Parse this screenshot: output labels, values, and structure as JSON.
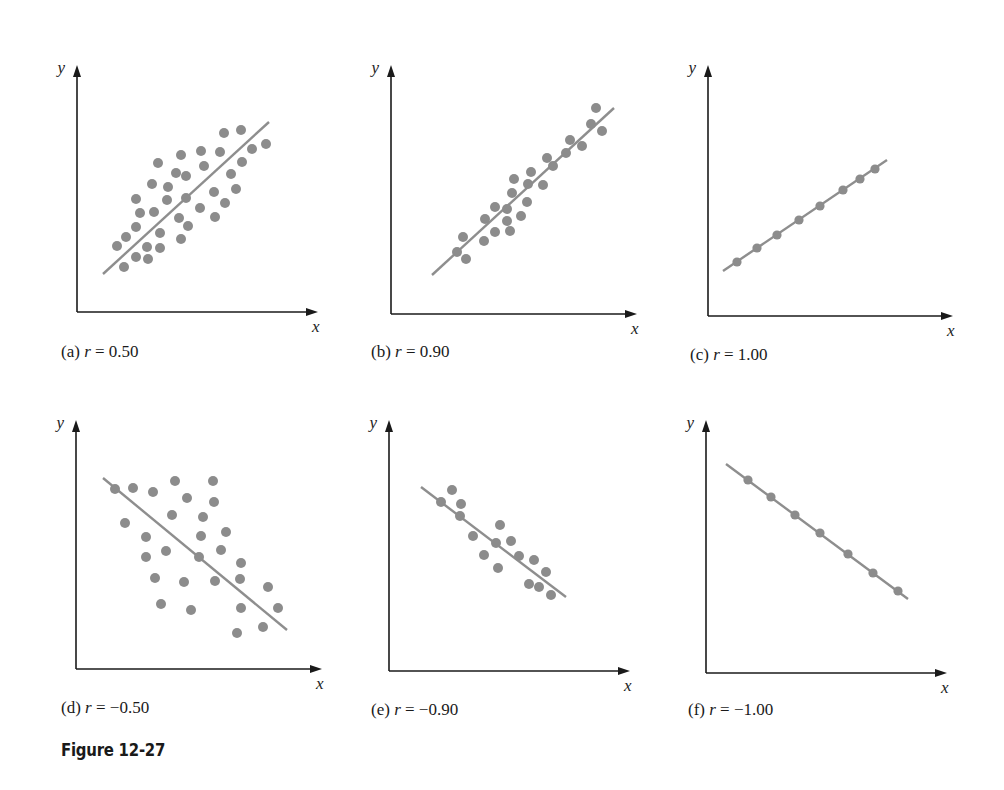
{
  "figure": {
    "title": "Figure 12-27",
    "point_color": "#8c8c8c",
    "line_color": "#8e8e8e",
    "axis_color": "#1a1a1a"
  },
  "chart_data": [
    {
      "type": "scatter",
      "id": "a",
      "caption_prefix": "(a)",
      "r_symbol": "r",
      "r_value": "0.50",
      "caption": "(a) r = 0.50",
      "xlabel": "x",
      "ylabel": "y",
      "grid": false,
      "trendline": true,
      "axes": {
        "origin": [
          77,
          312
        ],
        "y_top": 65,
        "x_end": 318
      },
      "line": [
        [
          103,
          274
        ],
        [
          269,
          122
        ]
      ],
      "points_px": [
        [
          117,
          246
        ],
        [
          126,
          237
        ],
        [
          124,
          267
        ],
        [
          136,
          257
        ],
        [
          136,
          227
        ],
        [
          140,
          213
        ],
        [
          136,
          199
        ],
        [
          147,
          247
        ],
        [
          148,
          259
        ],
        [
          160,
          233
        ],
        [
          160,
          248
        ],
        [
          154,
          212
        ],
        [
          152,
          184
        ],
        [
          158,
          163
        ],
        [
          168,
          187
        ],
        [
          167,
          200
        ],
        [
          176,
          173
        ],
        [
          181,
          155
        ],
        [
          186,
          176
        ],
        [
          186,
          198
        ],
        [
          179,
          218
        ],
        [
          181,
          239
        ],
        [
          188,
          226
        ],
        [
          200,
          208
        ],
        [
          201,
          151
        ],
        [
          204,
          166
        ],
        [
          220,
          152
        ],
        [
          214,
          192
        ],
        [
          215,
          217
        ],
        [
          225,
          203
        ],
        [
          231,
          174
        ],
        [
          236,
          189
        ],
        [
          224,
          133
        ],
        [
          241,
          130
        ],
        [
          242,
          162
        ],
        [
          252,
          149
        ],
        [
          266,
          144
        ]
      ]
    },
    {
      "type": "scatter",
      "id": "b",
      "caption_prefix": "(b)",
      "r_symbol": "r",
      "r_value": "0.90",
      "caption": "(b) r = 0.90",
      "xlabel": "x",
      "ylabel": "y",
      "grid": false,
      "trendline": true,
      "axes": {
        "origin": [
          391,
          314
        ],
        "y_top": 65,
        "x_end": 637
      },
      "line": [
        [
          432,
          275
        ],
        [
          614,
          108
        ]
      ],
      "points_px": [
        [
          457,
          252
        ],
        [
          463,
          237
        ],
        [
          466,
          259
        ],
        [
          484,
          241
        ],
        [
          485,
          219
        ],
        [
          495,
          232
        ],
        [
          495,
          207
        ],
        [
          507,
          209
        ],
        [
          507,
          221
        ],
        [
          510,
          231
        ],
        [
          512,
          193
        ],
        [
          514,
          179
        ],
        [
          521,
          216
        ],
        [
          527,
          202
        ],
        [
          528,
          184
        ],
        [
          531,
          172
        ],
        [
          543,
          185
        ],
        [
          547,
          158
        ],
        [
          553,
          166
        ],
        [
          566,
          153
        ],
        [
          570,
          140
        ],
        [
          582,
          146
        ],
        [
          591,
          124
        ],
        [
          596,
          108
        ],
        [
          602,
          131
        ]
      ]
    },
    {
      "type": "scatter",
      "id": "c",
      "caption_prefix": "(c)",
      "r_symbol": "r",
      "r_value": "1.00",
      "caption": "(c) r = 1.00",
      "xlabel": "x",
      "ylabel": "y",
      "grid": false,
      "trendline": true,
      "axes": {
        "origin": [
          708,
          316
        ],
        "y_top": 65,
        "x_end": 953
      },
      "line": [
        [
          723,
          271
        ],
        [
          887,
          160
        ]
      ],
      "points_px": [
        [
          737,
          262
        ],
        [
          757,
          248
        ],
        [
          777,
          235
        ],
        [
          799,
          220
        ],
        [
          820,
          206
        ],
        [
          843,
          190
        ],
        [
          860,
          179
        ],
        [
          875,
          169
        ]
      ]
    },
    {
      "type": "scatter",
      "id": "d",
      "caption_prefix": "(d)",
      "r_symbol": "r",
      "r_value": "−0.50",
      "caption": "(d) r = −0.50",
      "xlabel": "x",
      "ylabel": "y",
      "grid": false,
      "trendline": true,
      "axes": {
        "origin": [
          76,
          669
        ],
        "y_top": 420,
        "x_end": 322
      },
      "line": [
        [
          103,
          478
        ],
        [
          287,
          630
        ]
      ],
      "points_px": [
        [
          115,
          489
        ],
        [
          133,
          488
        ],
        [
          153,
          492
        ],
        [
          175,
          481
        ],
        [
          213,
          481
        ],
        [
          187,
          498
        ],
        [
          214,
          502
        ],
        [
          125,
          523
        ],
        [
          172,
          515
        ],
        [
          203,
          517
        ],
        [
          146,
          537
        ],
        [
          201,
          536
        ],
        [
          226,
          532
        ],
        [
          146,
          557
        ],
        [
          166,
          551
        ],
        [
          199,
          557
        ],
        [
          221,
          550
        ],
        [
          241,
          563
        ],
        [
          155,
          578
        ],
        [
          184,
          582
        ],
        [
          215,
          581
        ],
        [
          240,
          579
        ],
        [
          268,
          587
        ],
        [
          161,
          604
        ],
        [
          191,
          610
        ],
        [
          241,
          608
        ],
        [
          278,
          608
        ],
        [
          237,
          633
        ],
        [
          263,
          627
        ]
      ]
    },
    {
      "type": "scatter",
      "id": "e",
      "caption_prefix": "(e)",
      "r_symbol": "r",
      "r_value": "−0.90",
      "caption": "(e) r = −0.90",
      "xlabel": "x",
      "ylabel": "y",
      "grid": false,
      "trendline": true,
      "axes": {
        "origin": [
          389,
          671
        ],
        "y_top": 420,
        "x_end": 630
      },
      "line": [
        [
          421,
          487
        ],
        [
          566,
          597
        ]
      ],
      "points_px": [
        [
          441,
          502
        ],
        [
          452,
          490
        ],
        [
          461,
          504
        ],
        [
          460,
          516
        ],
        [
          473,
          536
        ],
        [
          484,
          555
        ],
        [
          496,
          543
        ],
        [
          500,
          525
        ],
        [
          498,
          568
        ],
        [
          511,
          541
        ],
        [
          519,
          556
        ],
        [
          534,
          560
        ],
        [
          546,
          572
        ],
        [
          529,
          584
        ],
        [
          539,
          587
        ],
        [
          551,
          595
        ]
      ]
    },
    {
      "type": "scatter",
      "id": "f",
      "caption_prefix": "(f)",
      "r_symbol": "r",
      "r_value": "−1.00",
      "caption": "(f) r = −1.00",
      "xlabel": "x",
      "ylabel": "y",
      "grid": false,
      "trendline": true,
      "axes": {
        "origin": [
          706,
          673
        ],
        "y_top": 420,
        "x_end": 947
      },
      "line": [
        [
          726,
          464
        ],
        [
          908,
          599
        ]
      ],
      "points_px": [
        [
          748,
          480
        ],
        [
          771,
          497
        ],
        [
          795,
          515
        ],
        [
          820,
          533
        ],
        [
          848,
          554
        ],
        [
          873,
          573
        ],
        [
          898,
          591
        ]
      ]
    }
  ]
}
